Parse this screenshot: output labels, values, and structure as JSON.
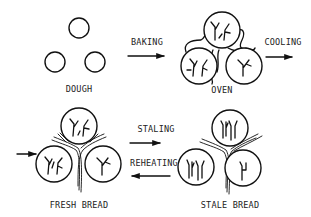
{
  "diagram": {
    "stages": [
      {
        "id": "dough",
        "label": "DOUGH"
      },
      {
        "id": "oven",
        "label": "OVEN"
      },
      {
        "id": "fresh_bread",
        "label": "FRESH BREAD"
      },
      {
        "id": "stale_bread",
        "label": "STALE BREAD"
      }
    ],
    "transitions": [
      {
        "from": "dough",
        "to": "oven",
        "label": "BAKING",
        "direction": "right"
      },
      {
        "from": "oven",
        "to": "fresh_bread",
        "label": "COOLING",
        "direction": "right"
      },
      {
        "from": "fresh_bread",
        "to": "stale_bread",
        "label": "STALING",
        "direction": "right"
      },
      {
        "from": "stale_bread",
        "to": "fresh_bread",
        "label": "REHEATING",
        "direction": "left"
      }
    ]
  }
}
